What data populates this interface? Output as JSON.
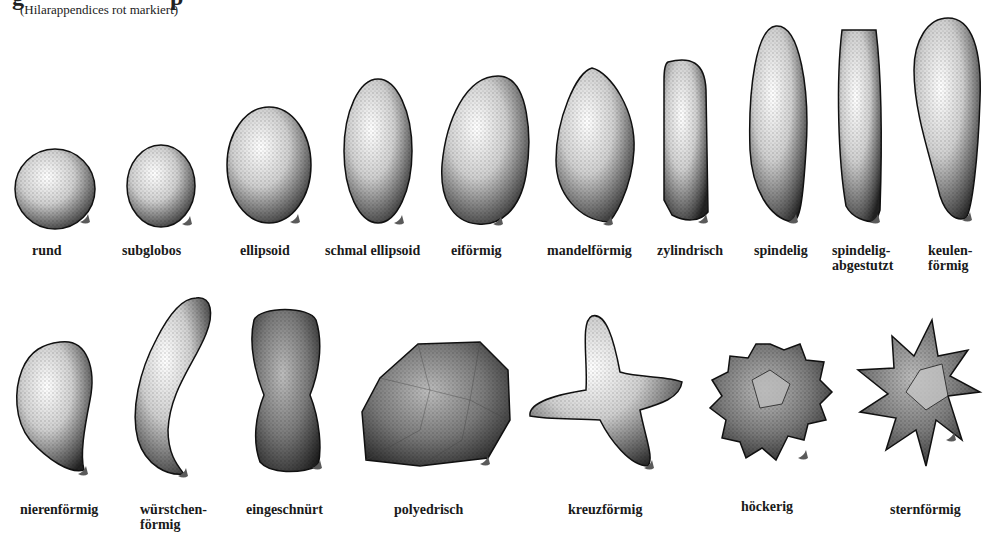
{
  "header": {
    "title_fragment": "g",
    "title_fragment_2": "p",
    "subtitle": "(Hilarappendices rot markiert)"
  },
  "colors": {
    "background": "#ffffff",
    "ink": "#111111",
    "hilar_appendix": "#5a5a5a"
  },
  "rows": [
    {
      "shapes": [
        {
          "id": "rund",
          "label": "rund",
          "icon": "round-spore-icon"
        },
        {
          "id": "subglobos",
          "label": "subglobos",
          "icon": "subglobose-spore-icon"
        },
        {
          "id": "ellipsoid",
          "label": "ellipsoid",
          "icon": "ellipsoid-spore-icon"
        },
        {
          "id": "schmal-ellipsoid",
          "label": "schmal ellipsoid",
          "icon": "narrow-ellipsoid-spore-icon"
        },
        {
          "id": "eifoermig",
          "label": "eiförmig",
          "icon": "ovoid-spore-icon"
        },
        {
          "id": "mandelfoermig",
          "label": "mandelförmig",
          "icon": "amygdaliform-spore-icon"
        },
        {
          "id": "zylindrisch",
          "label": "zylindrisch",
          "icon": "cylindrical-spore-icon"
        },
        {
          "id": "spindelig",
          "label": "spindelig",
          "icon": "fusiform-spore-icon"
        },
        {
          "id": "spindelig-abgestutzt",
          "label": "spindelig-\nabgestutzt",
          "icon": "truncate-fusiform-spore-icon"
        },
        {
          "id": "keulenfoermig",
          "label": "keulen-\nförmig",
          "icon": "clavate-spore-icon"
        }
      ]
    },
    {
      "shapes": [
        {
          "id": "nierenfoermig",
          "label": "nierenförmig",
          "icon": "reniform-spore-icon"
        },
        {
          "id": "wuerstchenfoermig",
          "label": "würstchen-\nförmig",
          "icon": "allantoid-spore-icon"
        },
        {
          "id": "eingeschnuert",
          "label": "eingeschnürt",
          "icon": "constricted-spore-icon"
        },
        {
          "id": "polyedrisch",
          "label": "polyedrisch",
          "icon": "polyhedral-spore-icon"
        },
        {
          "id": "kreuzfoermig",
          "label": "kreuzförmig",
          "icon": "cruciform-spore-icon"
        },
        {
          "id": "hoeckerig",
          "label": "höckerig",
          "icon": "nodulose-spore-icon"
        },
        {
          "id": "sternfoermig",
          "label": "sternförmig",
          "icon": "stellate-spore-icon"
        }
      ]
    }
  ]
}
